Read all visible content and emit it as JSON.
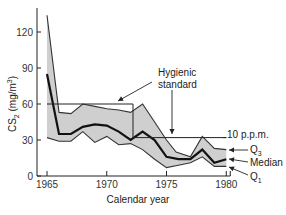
{
  "chart_data": {
    "type": "line",
    "title": "",
    "xlabel": "Calendar year",
    "ylabel": "CS2 (mg/m3)",
    "ylabel_parts": {
      "main": "CS",
      "sub": "2",
      "unit_open": " (mg/m",
      "sup": "3",
      "unit_close": ")"
    },
    "xlim": [
      1965,
      1980
    ],
    "ylim": [
      0,
      140
    ],
    "x_ticks": [
      1965,
      1970,
      1975,
      1980
    ],
    "y_ticks": [
      0,
      30,
      60,
      90,
      120
    ],
    "grid": false,
    "band_color": "#cfcfcf",
    "line_color": "#111111",
    "series": [
      {
        "name": "Q3",
        "x": [
          1965,
          1966,
          1967,
          1968,
          1969,
          1970,
          1971,
          1972,
          1973,
          1974,
          1975,
          1975.8,
          1977,
          1978,
          1979,
          1980
        ],
        "values": [
          134,
          53,
          52,
          60,
          58,
          56,
          55,
          53,
          60,
          45,
          30,
          20,
          16,
          33,
          23,
          22
        ]
      },
      {
        "name": "Median",
        "x": [
          1965,
          1966,
          1967,
          1968,
          1969,
          1970,
          1971,
          1972,
          1973,
          1974,
          1975,
          1976,
          1977,
          1978,
          1979,
          1980
        ],
        "values": [
          85,
          35,
          35,
          41,
          43,
          42,
          37,
          30,
          37,
          30,
          16,
          14,
          14,
          22,
          11,
          14
        ]
      },
      {
        "name": "Q1",
        "x": [
          1965,
          1966,
          1967,
          1968,
          1969,
          1970,
          1971,
          1972,
          1973,
          1974,
          1975,
          1976,
          1977,
          1978,
          1979,
          1980
        ],
        "values": [
          32,
          29,
          29,
          37,
          28,
          33,
          26,
          27,
          22,
          14,
          7,
          9,
          11,
          16,
          8,
          8
        ]
      },
      {
        "name": "Hygienic standard",
        "x": [
          1965,
          1972.2,
          1972.2,
          1980
        ],
        "values": [
          60,
          60,
          32,
          32
        ]
      }
    ],
    "annotations": [
      {
        "text": "Hygienic",
        "line2": "standard",
        "target": "hygienic-standard"
      },
      {
        "text": "10 p.p.m.",
        "target": "standard-level"
      },
      {
        "text": "Q3",
        "label_main": "Q",
        "label_sub": "3",
        "target": "Q3"
      },
      {
        "text": "Median",
        "target": "Median"
      },
      {
        "text": "Q1",
        "label_main": "Q",
        "label_sub": "1",
        "target": "Q1"
      }
    ]
  }
}
